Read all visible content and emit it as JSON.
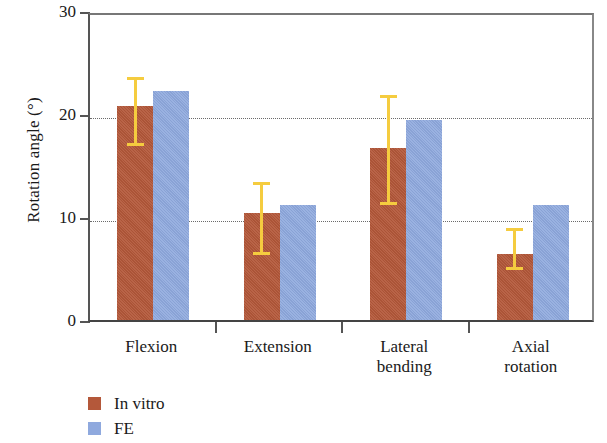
{
  "chart_data": {
    "type": "bar",
    "title": "",
    "xlabel": "",
    "ylabel": "Rotation angle (°)",
    "ylim": [
      0,
      30
    ],
    "yticks": [
      0,
      10,
      20,
      30
    ],
    "ytick_labels": [
      "0",
      "10",
      "20",
      "30"
    ],
    "grid": "horizontal dotted gridlines at 10 and 20",
    "gridlines": [
      10,
      20
    ],
    "legend_position": "below axes, left",
    "categories": [
      "Flexion",
      "Extension",
      "Lateral bending",
      "Axial rotation"
    ],
    "category_lines": [
      [
        "Flexion"
      ],
      [
        "Extension"
      ],
      [
        "Lateral",
        "bending"
      ],
      [
        "Axial",
        "rotation"
      ]
    ],
    "series": [
      {
        "name": "In vitro",
        "color": "#b4583a",
        "values": [
          20.8,
          10.4,
          16.7,
          6.4
        ],
        "errors_upper": [
          24.0,
          13.8,
          22.2,
          9.3
        ],
        "errors_lower": [
          17.3,
          6.7,
          11.6,
          5.2
        ]
      },
      {
        "name": "FE",
        "color": "#8fa9de",
        "values": [
          22.2,
          11.2,
          19.4,
          11.2
        ],
        "errors_upper": [
          null,
          null,
          null,
          null
        ],
        "errors_lower": [
          null,
          null,
          null,
          null
        ]
      }
    ],
    "errorbar_color": "#f5cc3f"
  },
  "legend": {
    "items": [
      {
        "label": "In vitro",
        "color": "#b4583a"
      },
      {
        "label": "FE",
        "color": "#8fa9de"
      }
    ]
  }
}
